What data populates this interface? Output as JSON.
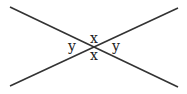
{
  "diagram": {
    "lines": [
      {
        "x1": 10,
        "y1": 7,
        "x2": 178,
        "y2": 87
      },
      {
        "x1": 10,
        "y1": 86,
        "x2": 178,
        "y2": 8
      }
    ],
    "line_color": "#333333",
    "labels": {
      "top": "x",
      "bottom": "x",
      "left": "y",
      "right": "y"
    }
  }
}
